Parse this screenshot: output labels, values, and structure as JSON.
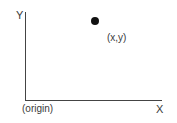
{
  "diagram": {
    "axes": {
      "x_label": "X",
      "y_label": "Y",
      "origin_label": "(origin)"
    },
    "point": {
      "label": "(x,y)",
      "color": "#111111"
    },
    "axis_color": "#444444"
  }
}
